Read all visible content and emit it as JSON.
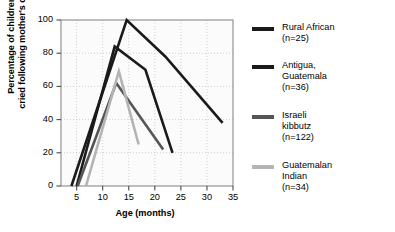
{
  "chart_data": {
    "type": "line",
    "title": "",
    "xlabel": "Age (months)",
    "ylabel_line1": "Percentage of children who",
    "ylabel_line2": "cried following mother's departure",
    "xlim": [
      2,
      35
    ],
    "ylim": [
      0,
      100
    ],
    "xticks": [
      5,
      10,
      15,
      20,
      25,
      30,
      35
    ],
    "yticks": [
      0,
      20,
      40,
      60,
      80,
      100
    ],
    "grid": true,
    "legend_position": "right",
    "series": [
      {
        "name": "Rural African",
        "n_label": "(n=25)",
        "legend_text": "Rural African\n(n=25)",
        "color": "#1a1a1a",
        "width": 2.6,
        "points": [
          [
            4.0,
            0
          ],
          [
            14.6,
            100
          ],
          [
            22.0,
            78
          ],
          [
            33.0,
            38
          ]
        ]
      },
      {
        "name": "Antigua, Guatemala",
        "n_label": "(n=36)",
        "legend_text": "Antigua,\nGuatemala\n(n=36)",
        "color": "#1a1a1a",
        "width": 2.6,
        "points": [
          [
            5.0,
            0
          ],
          [
            12.3,
            84
          ],
          [
            18.2,
            70
          ],
          [
            23.4,
            20
          ]
        ]
      },
      {
        "name": "Israeli kibbutz",
        "n_label": "(n=122)",
        "legend_text": "Israeli\nkibbutz\n(n=122)",
        "color": "#555555",
        "width": 2.6,
        "points": [
          [
            5.2,
            0
          ],
          [
            12.6,
            62
          ],
          [
            21.6,
            22
          ]
        ]
      },
      {
        "name": "Guatemalan Indian",
        "n_label": "(n=34)",
        "legend_text": "Guatemalan\nIndian\n(n=34)",
        "color": "#b4b4b4",
        "width": 2.6,
        "points": [
          [
            6.8,
            0
          ],
          [
            13.1,
            69
          ],
          [
            16.9,
            25
          ]
        ]
      }
    ]
  }
}
